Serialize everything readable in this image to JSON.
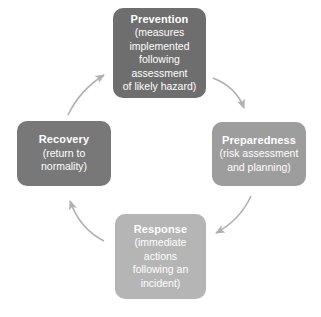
{
  "diagram": {
    "background_color": "#ffffff",
    "arrow_color": "#b0b0b0",
    "flow_direction": "clockwise",
    "stages": [
      {
        "id": "prevention",
        "name": "Prevention",
        "description_lines": [
          "(measures",
          "implemented",
          "following",
          "assessment",
          "of likely hazard)"
        ],
        "color": "#6e6e6e",
        "text_color": "#ffffff",
        "position": "top"
      },
      {
        "id": "preparedness",
        "name": "Preparedness",
        "description_lines": [
          "(risk assessment",
          "and planning)"
        ],
        "color": "#9d9d9d",
        "text_color": "#ffffff",
        "position": "right"
      },
      {
        "id": "response",
        "name": "Response",
        "description_lines": [
          "(immediate",
          "actions",
          "following an",
          "incident)"
        ],
        "color": "#b5b5b5",
        "text_color": "#ffffff",
        "position": "bottom"
      },
      {
        "id": "recovery",
        "name": "Recovery",
        "description_lines": [
          "(return to",
          "normality)"
        ],
        "color": "#787878",
        "text_color": "#ffffff",
        "position": "left"
      }
    ],
    "arrows": [
      {
        "id": "prevention-to-preparedness",
        "from": "Prevention",
        "to": "Preparedness"
      },
      {
        "id": "preparedness-to-response",
        "from": "Preparedness",
        "to": "Response"
      },
      {
        "id": "response-to-recovery",
        "from": "Response",
        "to": "Recovery"
      },
      {
        "id": "recovery-to-prevention",
        "from": "Recovery",
        "to": "Prevention"
      }
    ]
  }
}
